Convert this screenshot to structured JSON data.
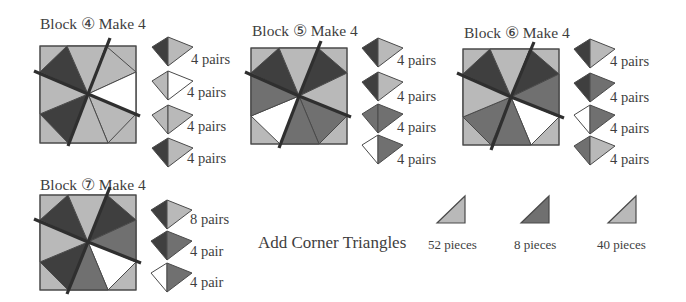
{
  "colors": {
    "dark": "#3f3f3f",
    "medium": "#707070",
    "light": "#b9b9b9",
    "white": "#ffffff",
    "outline": "#4a4a4a",
    "cut_line": "#2f2f2f"
  },
  "blocks": [
    {
      "id": "block-4",
      "title": "Block ④ Make 4",
      "pairs": [
        {
          "left": "dark",
          "right": "light",
          "label": "4 pairs"
        },
        {
          "left": "light",
          "right": "white",
          "label": "4 pairs"
        },
        {
          "left": "light",
          "right": "light",
          "label": "4 pairs"
        },
        {
          "left": "dark",
          "right": "light",
          "label": "4 pairs"
        }
      ]
    },
    {
      "id": "block-5",
      "title": "Block ⑤ Make 4",
      "pairs": [
        {
          "left": "dark",
          "right": "light",
          "label": "4 pairs"
        },
        {
          "left": "dark",
          "right": "light",
          "label": "4 pairs"
        },
        {
          "left": "medium",
          "right": "medium",
          "label": "4 pairs"
        },
        {
          "left": "white",
          "right": "medium",
          "label": "4 pairs"
        }
      ]
    },
    {
      "id": "block-6",
      "title": "Block ⑥ Make 4",
      "pairs": [
        {
          "left": "dark",
          "right": "light",
          "label": "4 pairs"
        },
        {
          "left": "dark",
          "right": "medium",
          "label": "4 pairs"
        },
        {
          "left": "white",
          "right": "medium",
          "label": "4 pairs"
        },
        {
          "left": "medium",
          "right": "light",
          "label": "4 pairs"
        }
      ]
    },
    {
      "id": "block-7",
      "title": "Block ⑦ Make 4",
      "pairs": [
        {
          "left": "dark",
          "right": "light",
          "label": "8 pairs"
        },
        {
          "left": "dark",
          "right": "medium",
          "label": "4 pair"
        },
        {
          "left": "white",
          "right": "medium",
          "label": "4 pair"
        }
      ]
    }
  ],
  "corner_triangles": {
    "label": "Add Corner Triangles",
    "items": [
      {
        "color": "light",
        "label": "52 pieces"
      },
      {
        "color": "medium",
        "label": "8 pieces"
      },
      {
        "color": "light",
        "label": "40 pieces"
      }
    ]
  }
}
